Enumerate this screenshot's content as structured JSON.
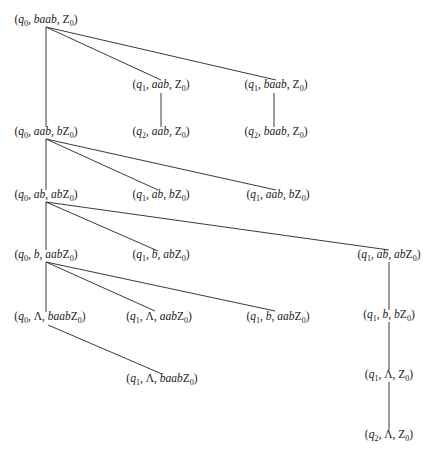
{
  "diagram": {
    "type": "computation-tree",
    "nodes": [
      {
        "id": "n0",
        "state": "q",
        "state_sub": "0",
        "input": "baab",
        "stack": "Z",
        "stack_sub": "0",
        "x": 46,
        "y": 15
      },
      {
        "id": "n1",
        "state": "q",
        "state_sub": "1",
        "input": "aab",
        "stack": "Z",
        "stack_sub": "0",
        "x": 161,
        "y": 80
      },
      {
        "id": "n2",
        "state": "q",
        "state_sub": "1",
        "input": "baab",
        "stack": "Z",
        "stack_sub": "0",
        "x": 276,
        "y": 80
      },
      {
        "id": "n3",
        "state": "q",
        "state_sub": "0",
        "input": "aab",
        "stack": "bZ",
        "stack_sub": "0",
        "x": 46,
        "y": 127
      },
      {
        "id": "n4",
        "state": "q",
        "state_sub": "2",
        "input": "aab",
        "stack": "Z",
        "stack_sub": "0",
        "x": 161,
        "y": 127
      },
      {
        "id": "n5",
        "state": "q",
        "state_sub": "2",
        "input": "baab",
        "stack": "Z",
        "stack_sub": "0",
        "x": 276,
        "y": 127
      },
      {
        "id": "n6",
        "state": "q",
        "state_sub": "0",
        "input": "ab",
        "stack": "abZ",
        "stack_sub": "0",
        "x": 46,
        "y": 190
      },
      {
        "id": "n7",
        "state": "q",
        "state_sub": "1",
        "input": "ab",
        "stack": "bZ",
        "stack_sub": "0",
        "x": 161,
        "y": 190
      },
      {
        "id": "n8",
        "state": "q",
        "state_sub": "1",
        "input": "aab",
        "stack": "bZ",
        "stack_sub": "0",
        "x": 278,
        "y": 190
      },
      {
        "id": "n9",
        "state": "q",
        "state_sub": "0",
        "input": "b",
        "stack": "aabZ",
        "stack_sub": "0",
        "x": 46,
        "y": 250
      },
      {
        "id": "n10",
        "state": "q",
        "state_sub": "1",
        "input": "b",
        "stack": "abZ",
        "stack_sub": "0",
        "x": 161,
        "y": 250
      },
      {
        "id": "n11",
        "state": "q",
        "state_sub": "1",
        "input": "ab",
        "stack": "abZ",
        "stack_sub": "0",
        "x": 389,
        "y": 250
      },
      {
        "id": "n12",
        "state": "q",
        "state_sub": "0",
        "input": "Λ",
        "stack": "baabZ",
        "stack_sub": "0",
        "x": 50,
        "y": 312
      },
      {
        "id": "n13",
        "state": "q",
        "state_sub": "1",
        "input": "Λ",
        "stack": "aabZ",
        "stack_sub": "0",
        "x": 159,
        "y": 312
      },
      {
        "id": "n14",
        "state": "q",
        "state_sub": "1",
        "input": "b",
        "stack": "aabZ",
        "stack_sub": "0",
        "x": 278,
        "y": 312
      },
      {
        "id": "n15",
        "state": "q",
        "state_sub": "1",
        "input": "b",
        "stack": "bZ",
        "stack_sub": "0",
        "x": 389,
        "y": 310
      },
      {
        "id": "n16",
        "state": "q",
        "state_sub": "1",
        "input": "Λ",
        "stack": "baabZ",
        "stack_sub": "0",
        "x": 162,
        "y": 374
      },
      {
        "id": "n17",
        "state": "q",
        "state_sub": "1",
        "input": "Λ",
        "stack": "Z",
        "stack_sub": "0",
        "x": 389,
        "y": 370
      },
      {
        "id": "n18",
        "state": "q",
        "state_sub": "2",
        "input": "Λ",
        "stack": "Z",
        "stack_sub": "0",
        "x": 389,
        "y": 430
      }
    ],
    "edges": [
      {
        "from": "n0",
        "to": "n3",
        "x1": 46,
        "y1": 27,
        "x2": 46,
        "y2": 127
      },
      {
        "from": "n0",
        "to": "n1",
        "x1": 46,
        "y1": 27,
        "x2": 161,
        "y2": 80
      },
      {
        "from": "n0",
        "to": "n2",
        "x1": 46,
        "y1": 27,
        "x2": 276,
        "y2": 80
      },
      {
        "from": "n1",
        "to": "n4",
        "x1": 161,
        "y1": 93,
        "x2": 161,
        "y2": 127
      },
      {
        "from": "n2",
        "to": "n5",
        "x1": 274,
        "y1": 93,
        "x2": 274,
        "y2": 127
      },
      {
        "from": "n3",
        "to": "n6",
        "x1": 46,
        "y1": 139,
        "x2": 46,
        "y2": 190
      },
      {
        "from": "n3",
        "to": "n7",
        "x1": 46,
        "y1": 139,
        "x2": 158,
        "y2": 190
      },
      {
        "from": "n3",
        "to": "n8",
        "x1": 46,
        "y1": 139,
        "x2": 276,
        "y2": 190
      },
      {
        "from": "n6",
        "to": "n9",
        "x1": 46,
        "y1": 202,
        "x2": 46,
        "y2": 250
      },
      {
        "from": "n6",
        "to": "n10",
        "x1": 46,
        "y1": 202,
        "x2": 158,
        "y2": 251
      },
      {
        "from": "n6",
        "to": "n11",
        "x1": 46,
        "y1": 202,
        "x2": 389,
        "y2": 250
      },
      {
        "from": "n9",
        "to": "n12",
        "x1": 46,
        "y1": 262,
        "x2": 46,
        "y2": 312
      },
      {
        "from": "n9",
        "to": "n13",
        "x1": 46,
        "y1": 262,
        "x2": 155,
        "y2": 311
      },
      {
        "from": "n9",
        "to": "n14",
        "x1": 46,
        "y1": 262,
        "x2": 275,
        "y2": 311
      },
      {
        "from": "n11",
        "to": "n15",
        "x1": 389,
        "y1": 262,
        "x2": 389,
        "y2": 310
      },
      {
        "from": "n12",
        "to": "n16",
        "x1": 48,
        "y1": 325,
        "x2": 162,
        "y2": 374
      },
      {
        "from": "n15",
        "to": "n17",
        "x1": 389,
        "y1": 322,
        "x2": 389,
        "y2": 370
      },
      {
        "from": "n17",
        "to": "n18",
        "x1": 389,
        "y1": 382,
        "x2": 389,
        "y2": 430
      }
    ],
    "colors": {
      "line": "#3a3a3a",
      "text": "#222222",
      "background": "#ffffff"
    }
  }
}
